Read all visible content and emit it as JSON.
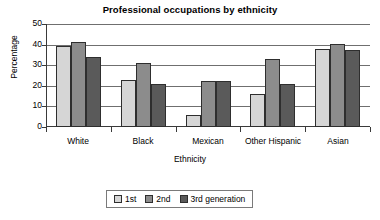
{
  "chart_data": {
    "type": "bar",
    "title": "Professional occupations by ethnicity",
    "xlabel": "Ethnicity",
    "ylabel": "Percentage",
    "categories": [
      "White",
      "Black",
      "Mexican",
      "Other Hispanic",
      "Asian"
    ],
    "series": [
      {
        "name": "1st",
        "values": [
          39.5,
          23,
          6,
          16,
          38
        ]
      },
      {
        "name": "2nd",
        "values": [
          41.5,
          31,
          22.5,
          33,
          40.5
        ]
      },
      {
        "name": "3rd generation",
        "values": [
          34,
          21,
          22.5,
          21,
          37.5
        ]
      }
    ],
    "ylim": [
      0,
      50
    ],
    "yticks": [
      0,
      10,
      20,
      30,
      40,
      50
    ],
    "ytick_labels": [
      "0",
      "10",
      "20",
      "30",
      "40",
      "50"
    ],
    "grid": true,
    "grid_axis": "y",
    "legend_position": "bottom-center",
    "colors": {
      "series_1st": "#d6d6d6",
      "series_2nd": "#8c8c8c",
      "series_3rd": "#5a5a5a",
      "bar_outline": "#2e2e2e",
      "gridline": "#6f6f6f",
      "axis": "#3a3a3a",
      "background": "#ffffff",
      "text": "#000000"
    }
  },
  "legend": {
    "entries": [
      "1st",
      "2nd",
      "3rd generation"
    ]
  }
}
